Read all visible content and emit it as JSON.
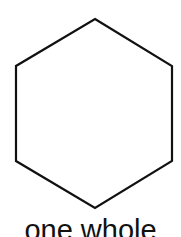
{
  "figure": {
    "shape": "hexagon",
    "stroke_color": "#111111",
    "fill_color": "#ffffff",
    "caption": "one whole"
  }
}
